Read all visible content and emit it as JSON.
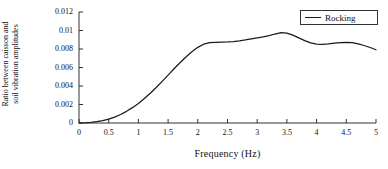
{
  "chart_data": {
    "type": "line",
    "title": "",
    "xlabel": "Frequency (Hz)",
    "ylabel": "Ratio between caisson and soil vibration amplitudes",
    "ylabel_line1": "Ratio between caisson and",
    "ylabel_line2": "soil vibration amplitudes",
    "xlim": [
      0,
      5
    ],
    "ylim": [
      0,
      0.012
    ],
    "grid": false,
    "legend_position": "top-right",
    "line_color": "#1a1a1a",
    "xticks": [
      "0",
      "0.5",
      "1",
      "1.5",
      "2",
      "2.5",
      "3",
      "3.5",
      "4",
      "4.5",
      "5"
    ],
    "xtick_values": [
      0,
      0.5,
      1,
      1.5,
      2,
      2.5,
      3,
      3.5,
      4,
      4.5,
      5
    ],
    "yticks": [
      "0",
      "0.002",
      "0.004",
      "0.006",
      "0.008",
      "0.01",
      "0.012"
    ],
    "ytick_values": [
      0,
      0.002,
      0.004,
      0.006,
      0.008,
      0.01,
      0.012
    ],
    "series": [
      {
        "name": "Rocking",
        "x": [
          0,
          0.1,
          0.2,
          0.3,
          0.4,
          0.5,
          0.6,
          0.7,
          0.8,
          0.9,
          1.0,
          1.1,
          1.2,
          1.3,
          1.4,
          1.5,
          1.6,
          1.7,
          1.8,
          1.9,
          2.0,
          2.1,
          2.2,
          2.3,
          2.4,
          2.5,
          2.6,
          2.7,
          2.8,
          2.9,
          3.0,
          3.1,
          3.2,
          3.3,
          3.4,
          3.5,
          3.6,
          3.7,
          3.8,
          3.9,
          4.0,
          4.1,
          4.2,
          4.3,
          4.4,
          4.5,
          4.6,
          4.7,
          4.8,
          4.9,
          5.0
        ],
        "values": [
          0.0,
          2e-05,
          6e-05,
          0.00014,
          0.00026,
          0.00042,
          0.00064,
          0.00092,
          0.00126,
          0.00166,
          0.00212,
          0.00264,
          0.00322,
          0.00384,
          0.0045,
          0.00518,
          0.00586,
          0.00652,
          0.00714,
          0.0077,
          0.00818,
          0.00852,
          0.00868,
          0.00872,
          0.00874,
          0.00876,
          0.0088,
          0.00888,
          0.00898,
          0.0091,
          0.0092,
          0.0093,
          0.00944,
          0.00962,
          0.00978,
          0.00972,
          0.0095,
          0.0092,
          0.0089,
          0.00866,
          0.00852,
          0.0085,
          0.00856,
          0.00864,
          0.0087,
          0.00872,
          0.00868,
          0.00856,
          0.00838,
          0.00816,
          0.00792
        ]
      }
    ]
  },
  "legend": {
    "entries": [
      {
        "label": "Rocking"
      }
    ]
  },
  "axes": {
    "x_title": "Frequency (Hz)",
    "y_title_line1": "Ratio between caisson and",
    "y_title_line2": "soil vibration amplitudes"
  }
}
